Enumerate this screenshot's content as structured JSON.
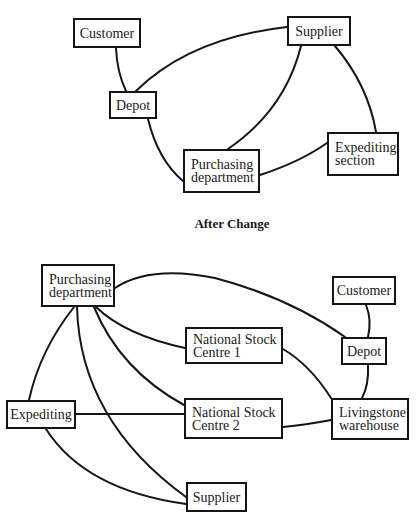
{
  "diagrams": [
    {
      "caption": "",
      "nodes": [
        {
          "id": "customer",
          "label": "Customer",
          "x": 73,
          "y": 18,
          "w": 68,
          "h": 30
        },
        {
          "id": "supplier",
          "label": "Supplier",
          "x": 287,
          "y": 16,
          "w": 64,
          "h": 30
        },
        {
          "id": "depot",
          "label": "Depot",
          "x": 109,
          "y": 91,
          "w": 48,
          "h": 28
        },
        {
          "id": "expediting-section",
          "label": "Expediting\nsection",
          "x": 327,
          "y": 132,
          "w": 72,
          "h": 44
        },
        {
          "id": "purchasing-department",
          "label": "Purchasing\ndepartment",
          "x": 183,
          "y": 149,
          "w": 77,
          "h": 44
        }
      ],
      "edges": [
        {
          "from": "customer",
          "to": "depot",
          "path": "M116 48 Q117 72 126 91"
        },
        {
          "from": "depot",
          "to": "supplier",
          "path": "M136 91 Q190 38 287 27"
        },
        {
          "from": "depot",
          "to": "purchasing-department",
          "path": "M148 119 Q158 160 183 181"
        },
        {
          "from": "supplier",
          "to": "purchasing-department",
          "path": "M301 46 Q285 110 228 149"
        },
        {
          "from": "supplier",
          "to": "expediting-section",
          "path": "M335 46 Q368 85 376 132"
        },
        {
          "from": "expediting-section",
          "to": "purchasing-department",
          "path": "M327 143 Q300 162 260 175"
        }
      ]
    },
    {
      "caption": "After Change",
      "nodes": [
        {
          "id": "purchasing-department",
          "label": "Purchasing\ndepartment",
          "x": 41,
          "y": 264,
          "w": 74,
          "h": 43
        },
        {
          "id": "customer",
          "label": "Customer",
          "x": 332,
          "y": 276,
          "w": 64,
          "h": 29
        },
        {
          "id": "national-stock-centre-1",
          "label": "National Stock\nCentre 1",
          "x": 185,
          "y": 327,
          "w": 98,
          "h": 37
        },
        {
          "id": "depot",
          "label": "Depot",
          "x": 341,
          "y": 337,
          "w": 46,
          "h": 28
        },
        {
          "id": "expediting",
          "label": "Expediting",
          "x": 6,
          "y": 400,
          "w": 70,
          "h": 29
        },
        {
          "id": "national-stock-centre-2",
          "label": "National Stock\nCentre 2",
          "x": 184,
          "y": 398,
          "w": 99,
          "h": 41
        },
        {
          "id": "livingstone-warehouse",
          "label": "Livingstone\nwarehouse",
          "x": 331,
          "y": 398,
          "w": 78,
          "h": 42
        },
        {
          "id": "supplier",
          "label": "Supplier",
          "x": 186,
          "y": 482,
          "w": 61,
          "h": 30
        }
      ],
      "edges": [
        {
          "from": "purchasing-department",
          "to": "depot",
          "path": "M115 288 Q150 265 215 278 Q290 298 345 337"
        },
        {
          "from": "customer",
          "to": "depot",
          "path": "M366 305 Q372 320 368 337"
        },
        {
          "from": "depot",
          "to": "livingstone-warehouse",
          "path": "M368 365 Q369 385 362 398"
        },
        {
          "from": "purchasing-department",
          "to": "national-stock-centre-1",
          "path": "M96 307 Q125 335 185 348"
        },
        {
          "from": "purchasing-department",
          "to": "national-stock-centre-2",
          "path": "M94 307 Q120 370 184 405"
        },
        {
          "from": "national-stock-centre-1",
          "to": "livingstone-warehouse",
          "path": "M283 349 Q310 365 331 398"
        },
        {
          "from": "national-stock-centre-2",
          "to": "livingstone-warehouse",
          "path": "M283 427 Q305 425 331 420"
        },
        {
          "from": "expediting",
          "to": "national-stock-centre-2",
          "path": "M76 414 L184 414"
        },
        {
          "from": "purchasing-department",
          "to": "expediting",
          "path": "M74 307 Q40 350 29 400"
        },
        {
          "from": "purchasing-department",
          "to": "supplier",
          "path": "M77 307 Q80 420 186 497"
        },
        {
          "from": "expediting",
          "to": "supplier",
          "path": "M46 429 Q85 490 186 504"
        }
      ]
    }
  ],
  "captions": {
    "after_change": "After Change"
  }
}
